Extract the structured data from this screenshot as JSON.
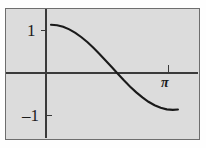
{
  "chart_data": {
    "type": "line",
    "title": "",
    "xlabel": "",
    "ylabel": "",
    "function": "y = cos(x)",
    "xlim": [
      -1.16,
      3.79
    ],
    "ylim": [
      -1.66,
      1.37
    ],
    "x_ticks": [
      3.14159
    ],
    "x_tick_labels": [
      "π"
    ],
    "y_ticks": [
      1,
      -1
    ],
    "y_tick_labels": [
      "1",
      "–1"
    ],
    "grid": false,
    "legend": null,
    "axes_style": "centered-cross",
    "series": [
      {
        "name": "cos(x)",
        "x": [
          0.0,
          0.1571,
          0.3142,
          0.4712,
          0.6283,
          0.7854,
          0.9425,
          1.0996,
          1.2566,
          1.4137,
          1.5708,
          1.7279,
          1.885,
          2.042,
          2.1991,
          2.3562,
          2.5133,
          2.6704,
          2.8274,
          2.9845,
          3.1416,
          3.2725
        ],
        "y": [
          1.0,
          0.9877,
          0.9511,
          0.891,
          0.809,
          0.7071,
          0.5878,
          0.454,
          0.309,
          0.1564,
          0.0,
          -0.1564,
          -0.309,
          -0.454,
          -0.5878,
          -0.7071,
          -0.809,
          -0.891,
          -0.9511,
          -0.9877,
          -1.0,
          -0.9914
        ]
      }
    ],
    "annotations": [
      {
        "name": "y-value-one",
        "text": "1",
        "at": [
          0,
          1
        ]
      },
      {
        "name": "y-value-negative-one",
        "text": "–1",
        "at": [
          0,
          -1
        ]
      },
      {
        "name": "x-value-pi",
        "text": "π",
        "at": [
          3.14159,
          0
        ]
      }
    ],
    "colors": {
      "curve": "#1a1a1a",
      "axis": "#3a3a3a",
      "plot_background": "#dcdcdc",
      "frame_border": "#6e6e6e",
      "figure_background": "#fefefe",
      "text": "#1b1b1b"
    }
  },
  "figure": {
    "curve_label": "cosine-curve",
    "frame_label": "plot-frame"
  }
}
